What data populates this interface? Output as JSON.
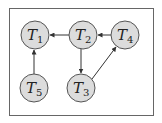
{
  "diagram": {
    "colors": {
      "frame": "#666666",
      "node_fill": "#dcdcdc",
      "node_stroke": "#555555",
      "edge": "#333333"
    },
    "nodes": [
      {
        "id": "T1",
        "base": "T",
        "sub": "1",
        "cx": 35,
        "cy": 35
      },
      {
        "id": "T2",
        "base": "T",
        "sub": "2",
        "cx": 83,
        "cy": 35
      },
      {
        "id": "T4",
        "base": "T",
        "sub": "4",
        "cx": 125,
        "cy": 35
      },
      {
        "id": "T5",
        "base": "T",
        "sub": "5",
        "cx": 34,
        "cy": 88
      },
      {
        "id": "T3",
        "base": "T",
        "sub": "3",
        "cx": 81,
        "cy": 88
      }
    ],
    "edges": [
      {
        "from": "T2",
        "to": "T1"
      },
      {
        "from": "T4",
        "to": "T2"
      },
      {
        "from": "T2",
        "to": "T3"
      },
      {
        "from": "T3",
        "to": "T4"
      },
      {
        "from": "T5",
        "to": "T1"
      }
    ]
  }
}
